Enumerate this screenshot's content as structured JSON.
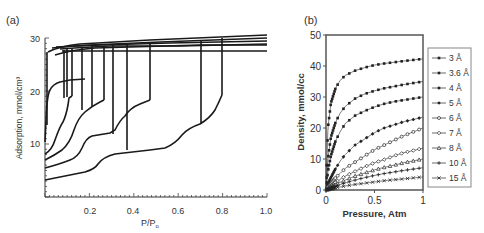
{
  "chart_data": [
    {
      "type": "line",
      "panel_label": "(a)",
      "title": "",
      "xlabel": "P/P₀",
      "ylabel": "Adsorption, mmol/cm³",
      "xlim": [
        0,
        1.0
      ],
      "ylim": [
        0,
        30
      ],
      "xticks": [
        "0.2",
        "0.4",
        "0.6",
        "0.8",
        "1.0"
      ],
      "yticks": [
        "10",
        "20",
        "30"
      ],
      "grid": false,
      "legend": null,
      "series": [
        {
          "name": "pore 1",
          "x": [
            0.0,
            0.005,
            0.01,
            0.02,
            0.05,
            0.1,
            0.3,
            0.6,
            1.0
          ],
          "y": [
            10,
            14,
            20,
            21.5,
            22.3,
            22.8,
            23.8,
            25,
            26.5
          ],
          "desorption_step": 0.02
        },
        {
          "name": "pore 2",
          "x": [
            0.0,
            0.02,
            0.04,
            0.06,
            0.08,
            0.1,
            0.3,
            0.6,
            1.0
          ],
          "y": [
            9,
            10.5,
            12.5,
            14.5,
            15.5,
            16.5,
            23.8,
            25.3,
            27
          ],
          "desorption_step": 0.08
        },
        {
          "name": "pore 3",
          "x": [
            0.0,
            0.05,
            0.1,
            0.15,
            0.2,
            0.25,
            0.3,
            0.6,
            1.0
          ],
          "y": [
            7.5,
            8.5,
            10,
            12,
            14,
            15,
            24,
            25.6,
            27.4
          ],
          "desorption_step": 0.2
        },
        {
          "name": "pore 4",
          "x": [
            0.0,
            0.1,
            0.2,
            0.25,
            0.3,
            0.4,
            0.5,
            0.6,
            1.0
          ],
          "y": [
            6,
            7,
            8,
            10.5,
            11,
            11.5,
            13.5,
            25.8,
            27.7
          ],
          "desorption_step": 0.5
        },
        {
          "name": "pore 5",
          "x": [
            0.0,
            0.1,
            0.2,
            0.3,
            0.4,
            0.5,
            0.6,
            0.7,
            0.8,
            1.0
          ],
          "y": [
            4,
            4.7,
            5.5,
            7.5,
            8,
            8.6,
            10.5,
            12,
            17,
            28
          ],
          "desorption_step": 0.8
        },
        {
          "name": "pore 6",
          "x": [
            0.0,
            0.3,
            0.6,
            0.8,
            1.0
          ],
          "y": [
            23.5,
            23.5,
            23.6,
            23.7,
            23.7
          ],
          "desorption_step": null
        }
      ],
      "annotations": [
        "vertical desorption drops at P/P₀ ≈ 0.03, 0.08, 0.1, 0.15, 0.2, 0.25, 0.33, 0.45, 0.5, 0.7, 0.8"
      ]
    },
    {
      "type": "line",
      "panel_label": "(b)",
      "title": "",
      "xlabel": "Pressure, Atm",
      "ylabel": "Density, mmol/cc",
      "xlim": [
        0,
        1
      ],
      "ylim": [
        0,
        50
      ],
      "xticks": [
        "0",
        "0.5",
        "1"
      ],
      "yticks": [
        "0",
        "10",
        "20",
        "30",
        "40",
        "50"
      ],
      "grid": false,
      "legend_position": "right",
      "x": [
        0,
        0.02,
        0.05,
        0.1,
        0.15,
        0.2,
        0.3,
        0.4,
        0.5,
        0.6,
        0.7,
        0.8,
        1.0
      ],
      "series": [
        {
          "name": "3 Å",
          "marker": "filled-square",
          "values": [
            0,
            20,
            28,
            33,
            35.5,
            37,
            38.5,
            39.5,
            40.3,
            40.8,
            41.2,
            41.6,
            42.3
          ]
        },
        {
          "name": "3.6 Å",
          "marker": "filled-square",
          "values": [
            0,
            10,
            17,
            22,
            25,
            27,
            29.5,
            31,
            32,
            32.8,
            33.4,
            34,
            35
          ]
        },
        {
          "name": "4 Å",
          "marker": "filled-square",
          "values": [
            0,
            6,
            11,
            16,
            19,
            21.5,
            24,
            25.5,
            26.8,
            27.8,
            28.5,
            29,
            30
          ]
        },
        {
          "name": "5 Å",
          "marker": "filled-diamond",
          "values": [
            0,
            2,
            4,
            7,
            9.5,
            11.5,
            14.5,
            16.5,
            18.5,
            20,
            21,
            22,
            23.5
          ]
        },
        {
          "name": "6 Å",
          "marker": "open-circle",
          "values": [
            0,
            1,
            2,
            4,
            5.5,
            7,
            9,
            11,
            13,
            14.5,
            16,
            17.5,
            20
          ]
        },
        {
          "name": "7 Å",
          "marker": "open-diamond",
          "values": [
            0,
            0.5,
            1.2,
            2.5,
            3.5,
            4.5,
            6,
            7.5,
            8.8,
            9.8,
            11,
            12,
            13.5
          ]
        },
        {
          "name": "8 Å",
          "marker": "open-triangle",
          "values": [
            0,
            0.3,
            0.9,
            1.8,
            2.5,
            3.2,
            4.5,
            5.5,
            6.5,
            7.3,
            8,
            8.8,
            10
          ]
        },
        {
          "name": "10 Å",
          "marker": "plus",
          "values": [
            0,
            0.2,
            0.6,
            1.2,
            1.8,
            2.3,
            3.2,
            4,
            4.7,
            5.3,
            5.8,
            6.3,
            7.2
          ]
        },
        {
          "name": "15 Å",
          "marker": "x",
          "values": [
            0,
            0.1,
            0.3,
            0.7,
            1,
            1.3,
            1.8,
            2.2,
            2.6,
            3,
            3.3,
            3.6,
            4.2
          ]
        }
      ]
    }
  ],
  "panels": {
    "a": {
      "label": "(a)",
      "ylabel": "Adsorption, mmol/cm³",
      "xlabel_main": "P/P",
      "xlabel_sub": "o",
      "yticks": [
        "30",
        "20",
        "10"
      ],
      "xticks": [
        "0.2",
        "0.4",
        "0.6",
        "0.8",
        "1.0"
      ]
    },
    "b": {
      "label": "(b)",
      "ylabel": "Density, mmol/cc",
      "xlabel": "Pressure, Atm",
      "yticks": [
        "50",
        "40",
        "30",
        "20",
        "10",
        "0"
      ],
      "xticks": [
        "0",
        "0.5",
        "1"
      ],
      "legend": [
        "3 Å",
        "3.6 Å",
        "4 Å",
        "5 Å",
        "6 Å",
        "7 Å",
        "8 Å",
        "10 Å",
        "15 Å"
      ]
    }
  }
}
